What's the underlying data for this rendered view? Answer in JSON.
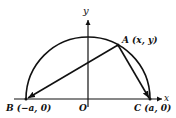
{
  "figure": {
    "type": "semicircle-inscribed-triangle",
    "axes": {
      "x_label": "x",
      "y_label": "y",
      "origin_label": "O"
    },
    "points": {
      "A": {
        "name": "A",
        "coords": "(x, y)",
        "label": "A (x, y)"
      },
      "B": {
        "name": "B",
        "coords": "(−a, 0)",
        "label": "B (−a, 0)"
      },
      "C": {
        "name": "C",
        "coords": "(a, 0)",
        "label": "C (a, 0)"
      }
    },
    "segments": [
      {
        "from": "A",
        "to": "B",
        "arrow": true
      },
      {
        "from": "A",
        "to": "C",
        "arrow": true
      }
    ],
    "curve": "upper semicircle of radius a centered at O",
    "colors": {
      "stroke": "#111111",
      "background": "#ffffff"
    }
  }
}
